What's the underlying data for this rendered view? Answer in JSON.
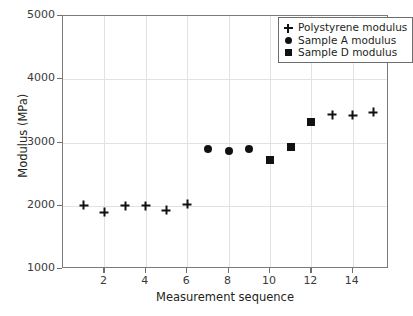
{
  "chart_data": {
    "type": "scatter",
    "title": "",
    "xlabel": "Measurement sequence",
    "ylabel": "Modulus (MPa)",
    "xlim": [
      0,
      15.75
    ],
    "ylim": [
      1000,
      5000
    ],
    "xticks": [
      2,
      4,
      6,
      8,
      10,
      12,
      14
    ],
    "yticks": [
      1000,
      2000,
      3000,
      4000,
      5000
    ],
    "grid": true,
    "legend_position": "top-right",
    "series": [
      {
        "name": "Polystyrene modulus",
        "marker": "plus",
        "color": "#111111",
        "x": [
          1,
          2,
          3,
          4,
          5,
          6,
          13,
          14,
          15
        ],
        "y": [
          2010,
          1900,
          2000,
          2000,
          1930,
          2020,
          3440,
          3430,
          3480
        ]
      },
      {
        "name": "Sample A modulus",
        "marker": "circle",
        "color": "#111111",
        "x": [
          7,
          8,
          9
        ],
        "y": [
          2905,
          2865,
          2900
        ]
      },
      {
        "name": "Sample D modulus",
        "marker": "square",
        "color": "#111111",
        "x": [
          10,
          11,
          12
        ],
        "y": [
          2730,
          2930,
          3320
        ]
      }
    ]
  },
  "axes": {
    "x_title": "Measurement sequence",
    "y_title": "Modulus (MPa)",
    "x_tick_labels": [
      "2",
      "4",
      "6",
      "8",
      "10",
      "12",
      "14"
    ],
    "y_tick_labels": [
      "1000",
      "2000",
      "3000",
      "4000",
      "5000"
    ]
  },
  "legend": {
    "entries": [
      {
        "symbol": "plus-marker-icon",
        "label": "Polystyrene modulus"
      },
      {
        "symbol": "circle-marker-icon",
        "label": "Sample A modulus"
      },
      {
        "symbol": "square-marker-icon",
        "label": "Sample D modulus"
      }
    ]
  },
  "colors": {
    "marker": "#111111",
    "axis": "#7b7b7b",
    "grid": "#e2e2e2",
    "text": "#231f20",
    "background": "#ffffff"
  }
}
